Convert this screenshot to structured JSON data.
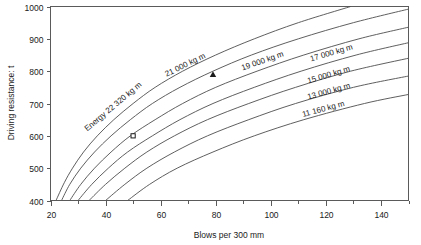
{
  "chart_data": {
    "type": "line",
    "title": "",
    "xlabel": "Blows per 300 mm",
    "ylabel": "Driving resistance: t",
    "xlim": [
      20,
      150
    ],
    "ylim": [
      400,
      1000
    ],
    "grid": false,
    "legend_position": "inline-curve-labels",
    "x_major_ticks": [
      20,
      40,
      60,
      80,
      100,
      120,
      140
    ],
    "x_minor_ticks": [
      30,
      50,
      70,
      90,
      110,
      130,
      150
    ],
    "x_tick_labels": [
      "20",
      "40",
      "60",
      "80",
      "100",
      "120",
      "140"
    ],
    "y_major_ticks": [
      400,
      500,
      600,
      700,
      800,
      900,
      1000
    ],
    "y_tick_labels": [
      "400",
      "500",
      "600",
      "700",
      "800",
      "900",
      "1000"
    ],
    "series": [
      {
        "name": "Energy 22 320 kg m",
        "label": "Energy 22 320 kg m",
        "energy_kg_m": 22320,
        "points": [
          [
            22,
            400
          ],
          [
            25,
            455
          ],
          [
            28,
            500
          ],
          [
            32,
            550
          ],
          [
            37,
            600
          ],
          [
            43,
            650
          ],
          [
            50,
            700
          ],
          [
            58,
            750
          ],
          [
            68,
            800
          ],
          [
            80,
            850
          ],
          [
            94,
            900
          ],
          [
            110,
            950
          ],
          [
            129,
            1000
          ]
        ]
      },
      {
        "name": "21 000 kg m",
        "label": "21 000 kg m",
        "energy_kg_m": 21000,
        "points": [
          [
            24,
            400
          ],
          [
            27,
            450
          ],
          [
            31,
            500
          ],
          [
            36,
            550
          ],
          [
            42,
            600
          ],
          [
            49,
            650
          ],
          [
            57,
            700
          ],
          [
            67,
            750
          ],
          [
            79,
            800
          ],
          [
            93,
            850
          ],
          [
            110,
            900
          ],
          [
            130,
            950
          ],
          [
            150,
            992
          ]
        ]
      },
      {
        "name": "19 000 kg m",
        "label": "19 000 kg m",
        "energy_kg_m": 19000,
        "points": [
          [
            27,
            400
          ],
          [
            31,
            450
          ],
          [
            36,
            500
          ],
          [
            42,
            550
          ],
          [
            49,
            600
          ],
          [
            58,
            650
          ],
          [
            68,
            700
          ],
          [
            80,
            750
          ],
          [
            95,
            800
          ],
          [
            112,
            850
          ],
          [
            132,
            900
          ],
          [
            150,
            936
          ]
        ]
      },
      {
        "name": "17 000 kg m",
        "label": "17 000 kg m",
        "energy_kg_m": 17000,
        "points": [
          [
            30,
            400
          ],
          [
            35,
            450
          ],
          [
            41,
            500
          ],
          [
            48,
            550
          ],
          [
            57,
            600
          ],
          [
            67,
            650
          ],
          [
            79,
            700
          ],
          [
            94,
            750
          ],
          [
            111,
            800
          ],
          [
            131,
            850
          ],
          [
            150,
            888
          ]
        ]
      },
      {
        "name": "15 000 kg m",
        "label": "15 000 kg m",
        "energy_kg_m": 15000,
        "points": [
          [
            34,
            400
          ],
          [
            40,
            450
          ],
          [
            47,
            500
          ],
          [
            55,
            550
          ],
          [
            65,
            600
          ],
          [
            77,
            650
          ],
          [
            92,
            700
          ],
          [
            109,
            750
          ],
          [
            129,
            800
          ],
          [
            150,
            840
          ]
        ]
      },
      {
        "name": "13 000 kg m",
        "label": "13 000 kg m",
        "energy_kg_m": 13000,
        "points": [
          [
            40,
            400
          ],
          [
            47,
            450
          ],
          [
            55,
            500
          ],
          [
            65,
            550
          ],
          [
            77,
            600
          ],
          [
            92,
            650
          ],
          [
            109,
            700
          ],
          [
            130,
            750
          ],
          [
            150,
            785
          ]
        ]
      },
      {
        "name": "11 160 kg m",
        "label": "11 160 kg m",
        "energy_kg_m": 11160,
        "points": [
          [
            48,
            400
          ],
          [
            56,
            450
          ],
          [
            66,
            500
          ],
          [
            79,
            550
          ],
          [
            94,
            600
          ],
          [
            112,
            650
          ],
          [
            134,
            700
          ],
          [
            150,
            728
          ]
        ]
      }
    ],
    "markers": [
      {
        "name": "observation-triangle",
        "shape": "triangle",
        "x": 79,
        "y": 790,
        "filled": true
      },
      {
        "name": "observation-square",
        "shape": "square",
        "x": 50,
        "y": 600,
        "filled": false
      }
    ]
  }
}
